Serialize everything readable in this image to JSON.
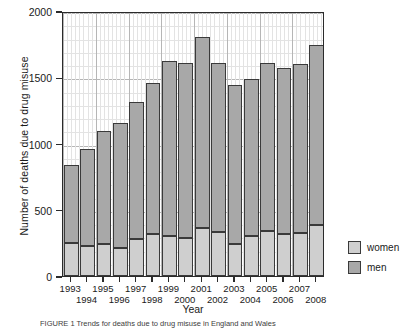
{
  "chart_data": {
    "type": "bar",
    "subtype": "stacked-vertical",
    "title": "",
    "xlabel": "Year",
    "ylabel": "Number of deaths due to drug misuse",
    "categories": [
      1993,
      1994,
      1995,
      1996,
      1997,
      1998,
      1999,
      2000,
      2001,
      2002,
      2003,
      2004,
      2005,
      2006,
      2007,
      2008
    ],
    "category_labels": [
      "1993",
      "1994",
      "1995",
      "1996",
      "1997",
      "1998",
      "1999",
      "2000",
      "2001",
      "2002",
      "2003",
      "2004",
      "2005",
      "2006",
      "2007",
      "2008"
    ],
    "series": [
      {
        "name": "men",
        "color": "#a8a8a8",
        "values": [
          590,
          725,
          855,
          940,
          1030,
          1140,
          1315,
          1320,
          1440,
          1270,
          1200,
          1190,
          1265,
          1255,
          1275,
          1355
        ]
      },
      {
        "name": "women",
        "color": "#cfcfcf",
        "values": [
          250,
          230,
          240,
          215,
          280,
          315,
          305,
          285,
          365,
          335,
          240,
          300,
          340,
          315,
          325,
          385
        ]
      }
    ],
    "totals": [
      840,
      955,
      1095,
      1155,
      1310,
      1455,
      1620,
      1605,
      1805,
      1605,
      1440,
      1490,
      1605,
      1570,
      1600,
      1740
    ],
    "stack_order": [
      "women",
      "men"
    ],
    "ylim": [
      0,
      2000
    ],
    "yticks": [
      0,
      500,
      1000,
      1500,
      2000
    ],
    "ytick_labels": [
      "0",
      "500",
      "1000",
      "1500",
      "2000"
    ],
    "y_minor_step": 100,
    "grid": true,
    "grid_minor": true,
    "legend": {
      "position": "right-bottom",
      "entries": [
        {
          "label": "women",
          "color": "#cfcfcf"
        },
        {
          "label": "men",
          "color": "#a8a8a8"
        }
      ]
    }
  },
  "axes": {
    "x_title": "Year",
    "y_title": "Number of deaths due to drug misuse"
  },
  "legend": {
    "women_label": "women",
    "men_label": "men"
  },
  "caption": {
    "text": "FIGURE 1 Trends for deaths due to drug misuse in England and Wales"
  }
}
